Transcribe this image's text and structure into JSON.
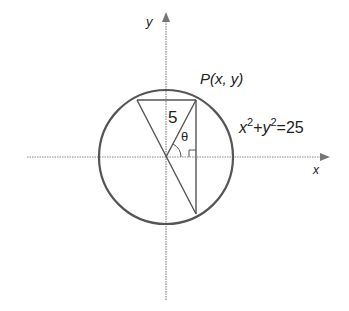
{
  "diagram": {
    "axes": {
      "x_label": "x",
      "y_label": "y"
    },
    "point_label": "P(x, y)",
    "radius_label": "5",
    "angle_label": "θ",
    "equation": {
      "x_base": "x",
      "x_exp": "2",
      "plus": "+",
      "y_base": "y",
      "y_exp": "2",
      "rhs": "=25"
    },
    "colors": {
      "stroke": "#555555",
      "axis": "#888888",
      "text": "#222222"
    }
  }
}
